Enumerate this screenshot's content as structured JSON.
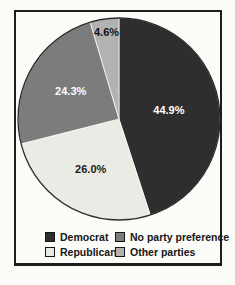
{
  "page": {
    "background": "#fbfbf8",
    "frame_border_color": "#1d1d1d"
  },
  "chart_data": {
    "type": "pie",
    "title": "",
    "start_angle_deg": 0,
    "direction": "clockwise",
    "slice_stroke": "#ffffff",
    "rim_color": "#2b2b2b",
    "slices": [
      {
        "name": "Democrat",
        "value": 44.9,
        "label": "44.9%",
        "color": "#2e2e2e",
        "label_color": "#ffffff",
        "label_r": 0.5
      },
      {
        "name": "Republican",
        "value": 26.0,
        "label": "26.0%",
        "color": "#ebebe5",
        "label_color": "#1a1a1a",
        "label_r": 0.58
      },
      {
        "name": "No party preference",
        "value": 24.3,
        "label": "24.3%",
        "color": "#7c7c7c",
        "label_color": "#ffffff",
        "label_r": 0.55
      },
      {
        "name": "Other parties",
        "value": 4.6,
        "label": "4.6%",
        "color": "#b2b2b2",
        "label_color": "#111111",
        "label_r": 0.86
      }
    ],
    "legend_position": "bottom",
    "grid": false
  },
  "legend": {
    "items": [
      {
        "label": "Democrat",
        "color": "#2e2e2e"
      },
      {
        "label": "No party preference",
        "color": "#7c7c7c"
      },
      {
        "label": "Republican",
        "color": "#ebebe5"
      },
      {
        "label": "Other parties",
        "color": "#b2b2b2"
      }
    ]
  }
}
